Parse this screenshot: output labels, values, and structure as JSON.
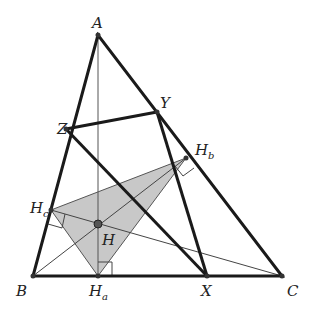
{
  "diagram": {
    "points": {
      "A": {
        "x": 98,
        "y": 35,
        "label": "A"
      },
      "B": {
        "x": 33,
        "y": 276,
        "label": "B"
      },
      "C": {
        "x": 282,
        "y": 276,
        "label": "C"
      },
      "X": {
        "x": 207,
        "y": 276,
        "label": "X"
      },
      "Y": {
        "x": 157,
        "y": 112,
        "label": "Y"
      },
      "Z": {
        "x": 66,
        "y": 129,
        "label": "Z"
      },
      "Ha": {
        "x": 98,
        "y": 276,
        "label": "H",
        "sub": "a"
      },
      "Hb": {
        "x": 186,
        "y": 158,
        "label": "H",
        "sub": "b"
      },
      "Hc": {
        "x": 51,
        "y": 210,
        "label": "H",
        "sub": "c"
      },
      "H": {
        "x": 98,
        "y": 224,
        "label": "H"
      }
    },
    "colors": {
      "thick_line": "#1a1a1a",
      "thin_line": "#333333",
      "fill": "#c8c8c8",
      "point": "#333333"
    }
  }
}
